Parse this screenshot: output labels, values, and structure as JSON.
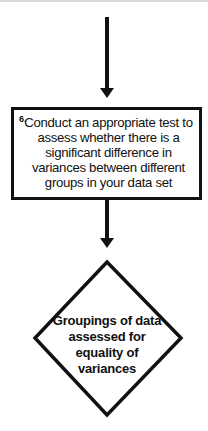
{
  "flowchart": {
    "step_box": {
      "number": "6.",
      "text": "Conduct an appropriate test to assess whether there is a significant difference in variances between different groups in your data set"
    },
    "decision_diamond": {
      "text": "Groupings of data assessed for equality of variances"
    },
    "colors": {
      "stroke": "#111111",
      "background": "#ffffff"
    }
  }
}
